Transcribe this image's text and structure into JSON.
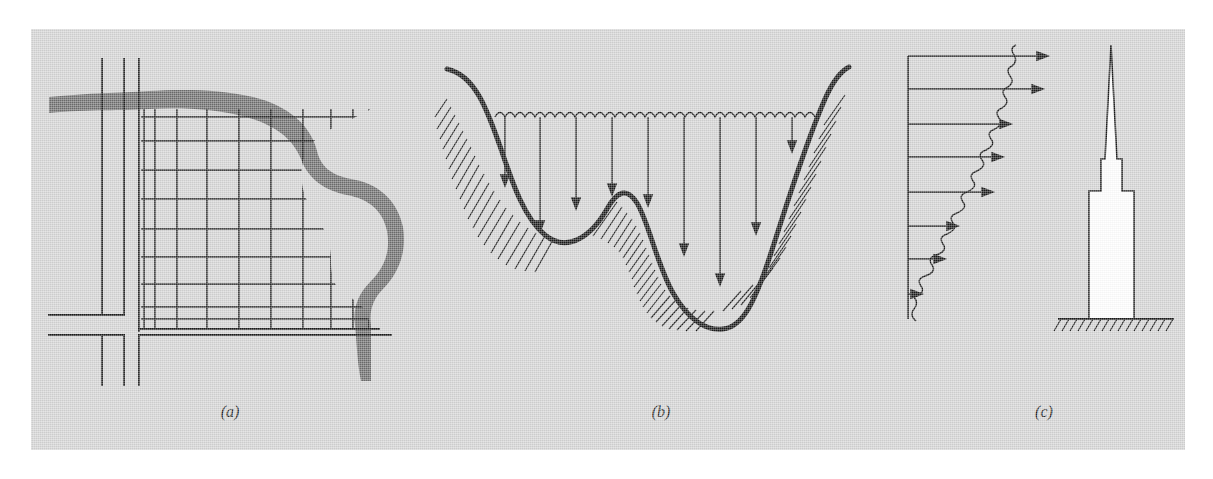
{
  "figure": {
    "background_color": "#d4d4d4",
    "page_color": "#ffffff",
    "ink_color": "#1a1a1a",
    "water_fill_color": "#6e6e6e",
    "building_fill_color": "#ffffff",
    "panel_count": 3,
    "captions": [
      {
        "key": "a",
        "label": "(a)"
      },
      {
        "key": "b",
        "label": "(b)"
      },
      {
        "key": "c",
        "label": "(c)"
      }
    ]
  },
  "panel_a": {
    "caption": "(a)",
    "title": "Plan view of a finite-difference grid over an urban block bounded by a river",
    "features": {
      "streets_vertical": 2,
      "streets_horizontal": 2,
      "street_style": "double parallel lines",
      "grid_rows": 9,
      "grid_columns": 9,
      "grid_clipped_by": "river",
      "river_label": "shaded meandering water body"
    }
  },
  "panel_b": {
    "caption": "(b)",
    "title": "Cross-section of a lake showing sounding lines from the water surface to the bed",
    "features": {
      "water_surface_style": "wavy line",
      "sounding_arrows": 10,
      "bed_profile": "thick curve with two troughs and a central rise",
      "bank_hatching": true,
      "bed_points": [
        {
          "x": 0.0,
          "depth_fraction": 0.0
        },
        {
          "x": 0.16,
          "depth_fraction": 0.78
        },
        {
          "x": 0.33,
          "depth_fraction": 0.42
        },
        {
          "x": 0.55,
          "depth_fraction": 0.72
        },
        {
          "x": 0.72,
          "depth_fraction": 0.96
        },
        {
          "x": 0.88,
          "depth_fraction": 0.4
        },
        {
          "x": 1.0,
          "depth_fraction": 0.0
        }
      ]
    }
  },
  "panel_c": {
    "caption": "(c)",
    "title": "Wind velocity profile acting on a tall building",
    "features": {
      "profile_style": "wavy gust line with horizontal load arrows",
      "load_arrows": 8,
      "profile_shape": "velocity increasing with height",
      "structure": "tall stepped tower with spire",
      "ground_hatching": true,
      "arrow_lengths_fraction": [
        1.0,
        0.97,
        0.83,
        0.79,
        0.73,
        0.55,
        0.42,
        0.12
      ]
    }
  }
}
